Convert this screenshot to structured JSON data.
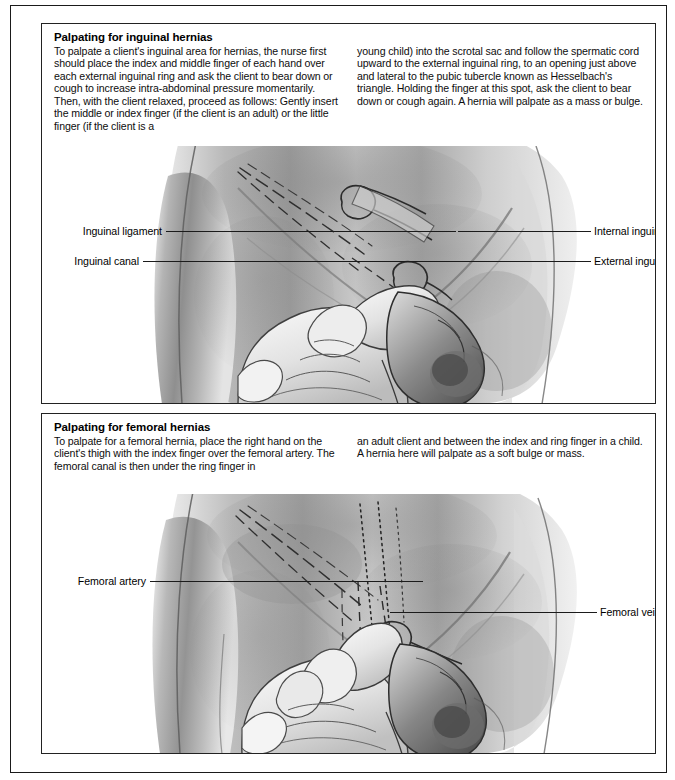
{
  "page": {
    "panels": [
      {
        "id": "inguinal",
        "title": "Palpating for inguinal hernias",
        "column_left": "To palpate a client's inguinal area for hernias, the nurse first should place the index and middle finger of each hand over each external inguinal ring and ask the client to bear down or cough to increase intra-abdominal pressure momentarily. Then, with the client relaxed, proceed as follows: Gently insert the middle or index finger (if the client is an adult) or the little finger (if the client is a",
        "column_right": "young child) into the scrotal sac and follow the spermatic cord upward to the external inguinal ring, to an opening just above and lateral to the pubic tubercle known as Hesselbach's triangle. Holding the finger at this spot, ask the client to bear down or cough again. A hernia will palpate as a mass or bulge.",
        "illustration_name": "inguinal-hernia-palpation-illustration",
        "labels": [
          {
            "text": "Inguinal ligament",
            "side": "left"
          },
          {
            "text": "Inguinal canal",
            "side": "left"
          },
          {
            "text": "Internal inguinal ring",
            "side": "right"
          },
          {
            "text": "External inguinal ring",
            "side": "right"
          }
        ]
      },
      {
        "id": "femoral",
        "title": "Palpating for femoral hernias",
        "column_left": "To palpate for a femoral hernia, place the right hand on the client's thigh with the index finger over the femoral artery. The femoral canal is then under the ring finger in",
        "column_right": "an adult client and between the index and ring finger in a child. A hernia here will palpate as a soft bulge or mass.",
        "illustration_name": "femoral-hernia-palpation-illustration",
        "labels": [
          {
            "text": "Femoral artery",
            "side": "left"
          },
          {
            "text": "Femoral vein",
            "side": "right"
          }
        ]
      }
    ]
  },
  "colors": {
    "page_background": "#ffffff",
    "border": "#1a1a1a",
    "text": "#111111",
    "leader_line": "#1b1b1b",
    "illustration_ink": "#3a3a3a"
  }
}
